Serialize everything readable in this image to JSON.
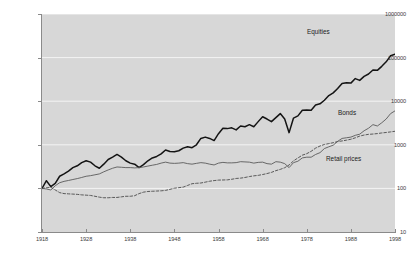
{
  "chart_data": {
    "type": "line",
    "title": "",
    "xlabel": "",
    "ylabel": "",
    "scale": "log",
    "grid": true,
    "legend_position": "inline-annotations",
    "background_color": "#d7d7d7",
    "gridline_color": "#f4f4f4",
    "axis_color": "#8a8a8a",
    "xlim": [
      1918,
      1998
    ],
    "ylim": [
      10,
      1000000
    ],
    "y_ticks": [
      {
        "value": 1000000,
        "label": "1000000"
      },
      {
        "value": 100000,
        "label": "100000"
      },
      {
        "value": 10000,
        "label": "10000"
      },
      {
        "value": 1000,
        "label": "1000"
      },
      {
        "value": 100,
        "label": "100"
      },
      {
        "value": 10,
        "label": "10"
      }
    ],
    "x_ticks": [
      {
        "value": 1918,
        "label": "1918"
      },
      {
        "value": 1928,
        "label": "1928"
      },
      {
        "value": 1938,
        "label": "1938"
      },
      {
        "value": 1948,
        "label": "1948"
      },
      {
        "value": 1958,
        "label": "1958"
      },
      {
        "value": 1968,
        "label": "1968"
      },
      {
        "value": 1978,
        "label": "1978"
      },
      {
        "value": 1988,
        "label": "1988"
      },
      {
        "value": 1998,
        "label": "1998"
      }
    ],
    "series": [
      {
        "name": "Equities",
        "label": "Equities",
        "color": "#141414",
        "width": 1.5,
        "dash": "none",
        "x": [
          1918,
          1919,
          1920,
          1921,
          1922,
          1923,
          1924,
          1925,
          1926,
          1927,
          1928,
          1929,
          1930,
          1931,
          1932,
          1933,
          1934,
          1935,
          1936,
          1937,
          1938,
          1939,
          1940,
          1941,
          1942,
          1943,
          1944,
          1945,
          1946,
          1947,
          1948,
          1949,
          1950,
          1951,
          1952,
          1953,
          1954,
          1955,
          1956,
          1957,
          1958,
          1959,
          1960,
          1961,
          1962,
          1963,
          1964,
          1965,
          1966,
          1967,
          1968,
          1969,
          1970,
          1971,
          1972,
          1973,
          1974,
          1975,
          1976,
          1977,
          1978,
          1979,
          1980,
          1981,
          1982,
          1983,
          1984,
          1985,
          1986,
          1987,
          1988,
          1989,
          1990,
          1991,
          1992,
          1993,
          1994,
          1995,
          1996,
          1997,
          1998
        ],
        "values": [
          100,
          150,
          110,
          130,
          190,
          215,
          250,
          300,
          330,
          390,
          430,
          400,
          330,
          290,
          360,
          460,
          520,
          600,
          520,
          430,
          380,
          360,
          300,
          350,
          430,
          500,
          540,
          620,
          760,
          700,
          690,
          730,
          840,
          900,
          860,
          1000,
          1400,
          1500,
          1400,
          1250,
          1800,
          2400,
          2350,
          2450,
          2200,
          2700,
          2600,
          2900,
          2600,
          3400,
          4400,
          3900,
          3400,
          4200,
          5200,
          3900,
          1900,
          4100,
          4600,
          6200,
          6300,
          6200,
          8200,
          8700,
          10500,
          13500,
          15500,
          19500,
          25500,
          26500,
          26000,
          33000,
          30000,
          37000,
          42000,
          52000,
          51000,
          63000,
          80000,
          110000,
          120000
        ]
      },
      {
        "name": "Bonds",
        "label": "Bonds",
        "color": "#5a5a5a",
        "width": 0.9,
        "dash": "none",
        "x": [
          1918,
          1919,
          1920,
          1921,
          1922,
          1923,
          1924,
          1925,
          1926,
          1927,
          1928,
          1929,
          1930,
          1931,
          1932,
          1933,
          1934,
          1935,
          1936,
          1937,
          1938,
          1939,
          1940,
          1941,
          1942,
          1943,
          1944,
          1945,
          1946,
          1947,
          1948,
          1949,
          1950,
          1951,
          1952,
          1953,
          1954,
          1955,
          1956,
          1957,
          1958,
          1959,
          1960,
          1961,
          1962,
          1963,
          1964,
          1965,
          1966,
          1967,
          1968,
          1969,
          1970,
          1971,
          1972,
          1973,
          1974,
          1975,
          1976,
          1977,
          1978,
          1979,
          1980,
          1981,
          1982,
          1983,
          1984,
          1985,
          1986,
          1987,
          1988,
          1989,
          1990,
          1991,
          1992,
          1993,
          1994,
          1995,
          1996,
          1997,
          1998
        ],
        "values": [
          100,
          97,
          92,
          115,
          135,
          145,
          152,
          160,
          168,
          178,
          190,
          196,
          205,
          215,
          240,
          265,
          290,
          310,
          305,
          300,
          300,
          295,
          300,
          310,
          325,
          340,
          355,
          380,
          400,
          380,
          375,
          380,
          390,
          370,
          360,
          375,
          390,
          380,
          360,
          345,
          380,
          395,
          385,
          385,
          390,
          410,
          405,
          400,
          380,
          395,
          400,
          370,
          360,
          410,
          400,
          370,
          300,
          390,
          420,
          500,
          520,
          520,
          600,
          660,
          820,
          900,
          980,
          1200,
          1400,
          1450,
          1500,
          1650,
          1750,
          2100,
          2400,
          2900,
          2700,
          3200,
          3900,
          5200,
          6000
        ]
      },
      {
        "name": "Retail prices",
        "label": "Retail prices",
        "color": "#4a4a4a",
        "width": 0.9,
        "dash": "dashed",
        "x": [
          1918,
          1919,
          1920,
          1921,
          1922,
          1923,
          1924,
          1925,
          1926,
          1927,
          1928,
          1929,
          1930,
          1931,
          1932,
          1933,
          1934,
          1935,
          1936,
          1937,
          1938,
          1939,
          1940,
          1941,
          1942,
          1943,
          1944,
          1945,
          1946,
          1947,
          1948,
          1949,
          1950,
          1951,
          1952,
          1953,
          1954,
          1955,
          1956,
          1957,
          1958,
          1959,
          1960,
          1961,
          1962,
          1963,
          1964,
          1965,
          1966,
          1967,
          1968,
          1969,
          1970,
          1971,
          1972,
          1973,
          1974,
          1975,
          1976,
          1977,
          1978,
          1979,
          1980,
          1981,
          1982,
          1983,
          1984,
          1985,
          1986,
          1987,
          1988,
          1989,
          1990,
          1991,
          1992,
          1993,
          1994,
          1995,
          1996,
          1997,
          1998
        ],
        "values": [
          100,
          103,
          106,
          92,
          80,
          76,
          75,
          74,
          73,
          71,
          70,
          69,
          66,
          63,
          61,
          61,
          62,
          62,
          64,
          66,
          66,
          68,
          76,
          82,
          85,
          86,
          87,
          88,
          90,
          95,
          101,
          104,
          107,
          117,
          128,
          131,
          133,
          139,
          146,
          151,
          155,
          156,
          157,
          162,
          169,
          172,
          178,
          187,
          194,
          199,
          208,
          219,
          233,
          255,
          273,
          298,
          345,
          428,
          499,
          578,
          626,
          710,
          838,
          937,
          1018,
          1065,
          1118,
          1186,
          1226,
          1278,
          1341,
          1446,
          1583,
          1674,
          1737,
          1765,
          1808,
          1871,
          1917,
          1976,
          2043
        ]
      }
    ]
  },
  "annotations": {
    "equities": "Equities",
    "bonds": "Bonds",
    "retail": "Retail prices"
  },
  "caption": ""
}
